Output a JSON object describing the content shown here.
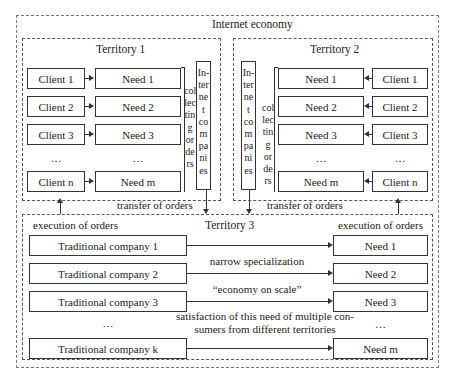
{
  "diagram": {
    "title": "Internet economy",
    "territory1": {
      "title": "Territory 1",
      "clients": [
        "Client 1",
        "Client 2",
        "Client 3",
        "…",
        "Client n"
      ],
      "needs": [
        "Need 1",
        "Need 2",
        "Need 3",
        "…",
        "Need m"
      ],
      "collecting_orders": [
        "col",
        "lec",
        "tin",
        "g",
        "or",
        "de",
        "rs"
      ],
      "internet_companies": [
        "In-",
        "ter",
        "ne",
        "t",
        "co",
        "m",
        "pa",
        "ni",
        "es"
      ]
    },
    "territory2": {
      "title": "Territory 2",
      "clients": [
        "Client 1",
        "Client 2",
        "Client 3",
        "…",
        "Client n"
      ],
      "needs": [
        "Need 1",
        "Need 2",
        "Need 3",
        "…",
        "Need m"
      ],
      "collecting_orders": [
        "col",
        "lec",
        "tin",
        "g",
        "or",
        "de",
        "rs"
      ],
      "internet_companies": [
        "In-",
        "ter",
        "ne",
        "t",
        "co",
        "m",
        "pa",
        "ni",
        "es"
      ]
    },
    "transfer_left": "transfer of orders",
    "transfer_right": "transfer of orders",
    "territory3": {
      "title": "Territory 3",
      "execution_left": "execution of orders",
      "execution_right": "execution of orders",
      "companies": [
        "Traditional company 1",
        "Traditional company 2",
        "Traditional company 3",
        "…",
        "Traditional company k"
      ],
      "needs": [
        "Need 1",
        "Need 2",
        "Need 3",
        "…",
        "Need m"
      ],
      "caption1": "narrow specialization",
      "caption2": "“economy on scale”",
      "caption3_line1": "satisfaction of this need of multiple con-",
      "caption3_line2": "sumers from different territories"
    }
  }
}
